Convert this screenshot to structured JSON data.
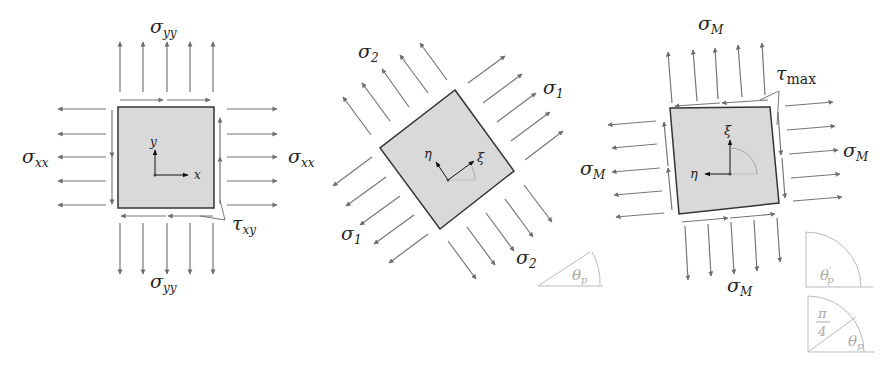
{
  "figure": {
    "panels": [
      {
        "id": "original-element",
        "element": {
          "fill": "#d9d9d9",
          "stroke": "#333333"
        },
        "axes": {
          "horizontal": "x",
          "vertical": "y"
        },
        "labels": {
          "top": {
            "base": "σ",
            "sub": "yy"
          },
          "bottom": {
            "base": "σ",
            "sub": "yy"
          },
          "left": {
            "base": "σ",
            "sub": "xx"
          },
          "right": {
            "base": "σ",
            "sub": "xx"
          },
          "shear": {
            "base": "τ",
            "sub": "xy"
          }
        }
      },
      {
        "id": "principal-element",
        "element": {
          "fill": "#d9d9d9",
          "stroke": "#333333",
          "rotation_deg": -36
        },
        "axes": {
          "primary": "ξ",
          "secondary": "η"
        },
        "labels": {
          "top_left": {
            "base": "σ",
            "sub": "2"
          },
          "top_right": {
            "base": "σ",
            "sub": "1"
          },
          "bottom_left": {
            "base": "σ",
            "sub": "1"
          },
          "bottom_right": {
            "base": "σ",
            "sub": "2"
          }
        },
        "angle_inset": {
          "base": "θ",
          "sub": "p"
        }
      },
      {
        "id": "max-shear-element",
        "element": {
          "fill": "#d9d9d9",
          "stroke": "#333333",
          "rotation_deg": -5
        },
        "axes": {
          "primary": "ξ",
          "secondary": "η"
        },
        "labels": {
          "top": {
            "base": "σ",
            "sub": "M"
          },
          "bottom": {
            "base": "σ",
            "sub": "M"
          },
          "left": {
            "base": "σ",
            "sub": "M"
          },
          "right": {
            "base": "σ",
            "sub": "M"
          },
          "shear": {
            "base": "τ",
            "sub": "max"
          }
        },
        "angle_insets": [
          {
            "base": "θ",
            "sub": "p",
            "prime": "′"
          },
          {
            "pi_num": "π",
            "pi_den": "4",
            "base": "θ",
            "sub": "p"
          }
        ]
      }
    ],
    "colors": {
      "arrow": "#6e6e6e",
      "element_fill": "#d9d9d9",
      "element_stroke": "#333333",
      "inset": "#aaaaaa",
      "text": "#222222"
    }
  }
}
